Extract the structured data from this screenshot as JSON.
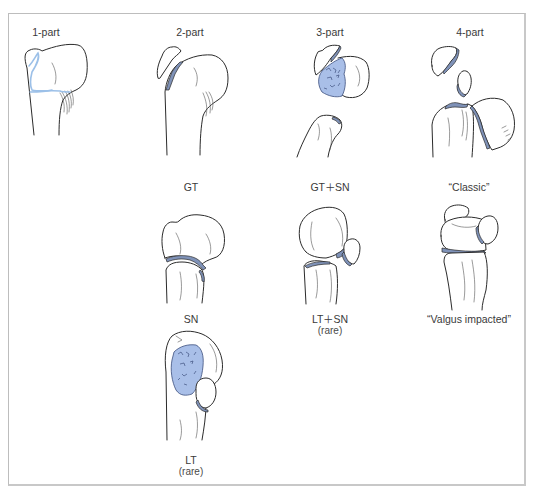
{
  "diagram": {
    "colors": {
      "border": "#bdbdbd",
      "line": "#2b2b2b",
      "fracture_fill": "#7f92b8",
      "cancellous_fill": "#a9bfe8",
      "fracture_line_1part": "#9cc0e8"
    },
    "columns": [
      {
        "id": "1-part",
        "label": "1-part"
      },
      {
        "id": "2-part",
        "label": "2-part"
      },
      {
        "id": "3-part",
        "label": "3-part"
      },
      {
        "id": "4-part",
        "label": "4-part"
      }
    ],
    "panels": {
      "one_part": {
        "label": "1-part"
      },
      "two_part_sn": {
        "label": "2-part",
        "caption": "SN"
      },
      "two_part_gt": {
        "caption": "GT"
      },
      "two_part_lt": {
        "caption": "LT",
        "note": "(rare)"
      },
      "three_part_gt_sn": {
        "label": "3-part",
        "caption": "GT＋SN"
      },
      "three_part_lt_sn": {
        "caption": "LT＋SN",
        "note": "(rare)"
      },
      "four_part_classic": {
        "label": "4-part",
        "caption": "“Classic”"
      },
      "four_part_valgus": {
        "caption": "“Valgus impacted”"
      }
    }
  }
}
